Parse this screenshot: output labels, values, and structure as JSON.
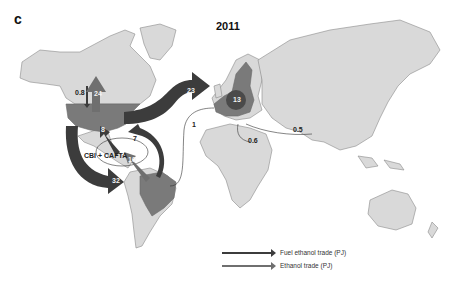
{
  "figure": {
    "panel_label": "c",
    "title": "2011",
    "colors": {
      "land": "#d9d9d9",
      "border": "#8a8a8a",
      "highlight_country": "#7a7a7a",
      "fuel_ethanol_arrow": "#3c3c3c",
      "ethanol_arrow": "#6f6f6f",
      "background": "#ffffff"
    },
    "highlighted_regions": [
      "United States",
      "Brazil",
      "European Union"
    ],
    "region_annotation": "CBI + CAFTA",
    "flows": [
      {
        "id": "us-to-eu",
        "from": "United States",
        "to": "European Union",
        "value": "23",
        "type": "fuel ethanol"
      },
      {
        "id": "us-to-canada",
        "from": "United States",
        "to": "Canada",
        "value": "24",
        "type": "ethanol"
      },
      {
        "id": "canada-to-us",
        "from": "Canada",
        "to": "United States",
        "value": "0.8",
        "type": "fuel ethanol"
      },
      {
        "id": "us-to-brazil",
        "from": "United States",
        "to": "Brazil",
        "value": "32",
        "type": "fuel ethanol"
      },
      {
        "id": "brazil-to-us",
        "from": "Brazil",
        "to": "United States",
        "value": "7",
        "type": "fuel ethanol"
      },
      {
        "id": "cbi-to-us",
        "from": "CBI + CAFTA",
        "to": "United States",
        "value": "8",
        "type": "fuel ethanol"
      },
      {
        "id": "brazil-to-cbi",
        "from": "Brazil",
        "to": "CBI + CAFTA",
        "value": "10",
        "type": "ethanol"
      },
      {
        "id": "brazil-to-eu",
        "from": "Brazil",
        "to": "European Union",
        "value": "1",
        "type": "fuel ethanol"
      },
      {
        "id": "intra-eu",
        "from": "European Union",
        "to": "European Union",
        "value": "13",
        "type": "ethanol"
      },
      {
        "id": "pakistan-to-eu",
        "from": "Pakistan",
        "to": "European Union",
        "value": "0.5",
        "type": "fuel ethanol"
      },
      {
        "id": "egypt-to-eu",
        "from": "Egypt",
        "to": "European Union",
        "value": "0.6",
        "type": "fuel ethanol"
      }
    ],
    "legend": [
      {
        "label": "Fuel ethanol trade (PJ)",
        "color": "#3c3c3c"
      },
      {
        "label": "Ethanol trade (PJ)",
        "color": "#6f6f6f"
      }
    ]
  }
}
